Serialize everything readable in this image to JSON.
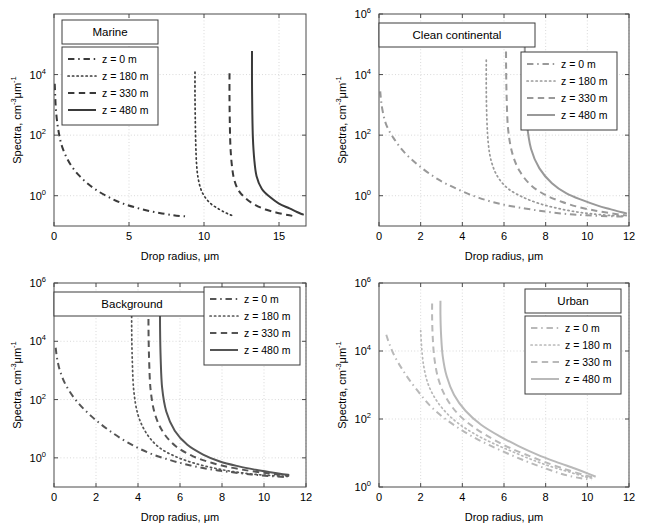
{
  "figure": {
    "width": 645,
    "height": 529,
    "background": "#ffffff",
    "panel_count": 4
  },
  "common": {
    "xlabel": "Drop radius, μm",
    "ylabel_main": "Spectra, cm",
    "ylabel_sup1": "-3",
    "ylabel_mid": "μm",
    "ylabel_sup2": "-1",
    "ylabel_full": "Spectra, cm-3 μm-1",
    "legend_labels": [
      "z = 0 m",
      "z = 180 m",
      "z = 330 m",
      "z = 480 m"
    ],
    "line_styles": [
      "dashdot",
      "dotted",
      "dashed",
      "solid"
    ],
    "mantissa": "10"
  },
  "chart_data": [
    {
      "type": "line",
      "title": "Marine",
      "panel_index": 0,
      "position": "top-left",
      "xlabel": "Drop radius, μm",
      "ylabel": "Spectra, cm-3 μm-1",
      "xlim": [
        0,
        16.8
      ],
      "ylim": [
        0.1,
        1000000
      ],
      "xticks": [
        0,
        5,
        10,
        15
      ],
      "xticklabels": [
        "0",
        "5",
        "10",
        "15"
      ],
      "yticks": [
        1,
        100,
        10000
      ],
      "yticklabels": [
        "10^0",
        "10^2",
        "10^4"
      ],
      "ytick_exponents": [
        "0",
        "2",
        "4"
      ],
      "yscale": "log",
      "grid": true,
      "legend_position": "upper-left",
      "title_box_position": "upper-left-above-legend",
      "line_color": "#3a3a3a",
      "series": [
        {
          "name": "z = 0 m",
          "style": "dashdot",
          "x": [
            0.05,
            0.08,
            0.12,
            0.2,
            0.32,
            0.5,
            0.8,
            1.2,
            1.7,
            2.3,
            3.0,
            3.8,
            4.6,
            5.5,
            6.4,
            7.2,
            7.9,
            8.4,
            8.7,
            8.9
          ],
          "y": [
            5000,
            2000,
            800,
            300,
            120,
            48,
            20,
            9.0,
            4.5,
            2.4,
            1.35,
            0.82,
            0.55,
            0.4,
            0.31,
            0.26,
            0.23,
            0.215,
            0.21,
            0.205
          ]
        },
        {
          "name": "z = 180 m",
          "style": "dotted",
          "x": [
            9.4,
            9.4,
            9.42,
            9.45,
            9.5,
            9.6,
            9.8,
            10.1,
            10.5,
            11.0,
            11.4,
            11.7,
            11.9,
            12.0
          ],
          "y": [
            12000,
            2000,
            300,
            50,
            12,
            4.0,
            1.6,
            0.85,
            0.52,
            0.36,
            0.28,
            0.24,
            0.22,
            0.21
          ]
        },
        {
          "name": "z = 330 m",
          "style": "dashed",
          "x": [
            11.7,
            11.7,
            11.72,
            11.76,
            11.85,
            12.0,
            12.3,
            12.8,
            13.4,
            14.1,
            14.8,
            15.3,
            15.7,
            15.9
          ],
          "y": [
            11000,
            1800,
            280,
            45,
            11,
            3.6,
            1.5,
            0.8,
            0.5,
            0.35,
            0.28,
            0.245,
            0.225,
            0.215
          ]
        },
        {
          "name": "z = 480 m",
          "style": "solid",
          "x": [
            13.2,
            13.2,
            13.22,
            13.26,
            13.35,
            13.5,
            13.85,
            14.4,
            15.0,
            15.7,
            16.2,
            16.5,
            16.65
          ],
          "y": [
            60000,
            6000,
            600,
            80,
            16,
            4.5,
            1.7,
            0.9,
            0.55,
            0.38,
            0.29,
            0.25,
            0.235
          ]
        }
      ]
    },
    {
      "type": "line",
      "title": "Clean continental",
      "panel_index": 1,
      "position": "top-right",
      "xlabel": "Drop radius, μm",
      "ylabel": "Spectra, cm-3 μm-1",
      "xlim": [
        0,
        12
      ],
      "ylim": [
        0.1,
        1000000
      ],
      "xticks": [
        0,
        2,
        4,
        6,
        8,
        10,
        12
      ],
      "xticklabels": [
        "0",
        "2",
        "4",
        "6",
        "8",
        "10",
        "12"
      ],
      "yticks": [
        1,
        100,
        10000,
        1000000
      ],
      "yticklabels": [
        "10^0",
        "10^2",
        "10^4",
        "10^6"
      ],
      "ytick_exponents": [
        "0",
        "2",
        "4",
        "6"
      ],
      "yscale": "log",
      "grid": true,
      "legend_position": "middle-right",
      "title_box_position": "top-left-wide",
      "line_color": "#999999",
      "series": [
        {
          "name": "z = 0 m",
          "style": "dashdot",
          "x": [
            0.06,
            0.1,
            0.18,
            0.35,
            0.7,
            1.2,
            1.9,
            2.8,
            3.8,
            4.8,
            5.9,
            7.0,
            8.0,
            9.0,
            10.0,
            11.0,
            11.7
          ],
          "y": [
            2800,
            1400,
            600,
            220,
            80,
            28,
            10,
            3.6,
            1.6,
            0.85,
            0.52,
            0.38,
            0.3,
            0.25,
            0.225,
            0.21,
            0.205
          ]
        },
        {
          "name": "z = 180 m",
          "style": "dotted",
          "x": [
            5.15,
            5.15,
            5.18,
            5.25,
            5.4,
            5.7,
            6.2,
            6.9,
            7.7,
            8.6,
            9.5,
            10.4,
            11.2,
            11.8
          ],
          "y": [
            30000,
            3000,
            300,
            50,
            13,
            4.2,
            1.7,
            0.9,
            0.55,
            0.38,
            0.29,
            0.245,
            0.22,
            0.21
          ]
        },
        {
          "name": "z = 330 m",
          "style": "dashed",
          "x": [
            6.1,
            6.1,
            6.13,
            6.2,
            6.4,
            6.75,
            7.3,
            8.0,
            8.8,
            9.6,
            10.4,
            11.1,
            11.6,
            11.9
          ],
          "y": [
            300000,
            20000,
            1500,
            150,
            25,
            6.5,
            2.2,
            1.05,
            0.62,
            0.42,
            0.32,
            0.265,
            0.235,
            0.22
          ]
        },
        {
          "name": "z = 480 m",
          "style": "solid",
          "x": [
            7.0,
            7.0,
            7.03,
            7.1,
            7.3,
            7.7,
            8.3,
            9.0,
            9.8,
            10.5,
            11.1,
            11.6,
            11.9
          ],
          "y": [
            400000,
            30000,
            2500,
            250,
            35,
            8.0,
            2.6,
            1.2,
            0.7,
            0.47,
            0.36,
            0.29,
            0.26
          ]
        }
      ]
    },
    {
      "type": "line",
      "title": "Background",
      "panel_index": 2,
      "position": "bottom-left",
      "xlabel": "Drop radius, μm",
      "ylabel": "Spectra, cm-3 μm-1",
      "xlim": [
        0,
        12
      ],
      "ylim": [
        0.1,
        1000000
      ],
      "xticks": [
        0,
        2,
        4,
        6,
        8,
        10,
        12
      ],
      "xticklabels": [
        "0",
        "2",
        "4",
        "6",
        "8",
        "10",
        "12"
      ],
      "yticks": [
        1,
        100,
        10000,
        1000000
      ],
      "yticklabels": [
        "10^0",
        "10^2",
        "10^4",
        "10^6"
      ],
      "ytick_exponents": [
        "0",
        "2",
        "4",
        "6"
      ],
      "yscale": "log",
      "grid": true,
      "legend_position": "top-right",
      "title_box_position": "top-left-wide",
      "line_color": "#555555",
      "series": [
        {
          "name": "z = 0 m",
          "style": "dashdot",
          "x": [
            0.08,
            0.15,
            0.3,
            0.6,
            1.1,
            1.8,
            2.6,
            3.5,
            4.5,
            5.5,
            6.5,
            7.5,
            8.5,
            9.4,
            10.2,
            10.8,
            11.1
          ],
          "y": [
            6000,
            2500,
            900,
            280,
            85,
            26,
            9.0,
            3.4,
            1.5,
            0.85,
            0.55,
            0.4,
            0.32,
            0.27,
            0.24,
            0.225,
            0.22
          ]
        },
        {
          "name": "z = 180 m",
          "style": "dotted",
          "x": [
            3.7,
            3.7,
            3.73,
            3.8,
            4.0,
            4.4,
            5.0,
            5.8,
            6.7,
            7.6,
            8.5,
            9.4,
            10.2,
            10.9,
            11.2
          ],
          "y": [
            300000,
            25000,
            2000,
            200,
            30,
            7.0,
            2.3,
            1.1,
            0.65,
            0.45,
            0.34,
            0.28,
            0.25,
            0.235,
            0.23
          ]
        },
        {
          "name": "z = 330 m",
          "style": "dashed",
          "x": [
            4.5,
            4.5,
            4.53,
            4.6,
            4.8,
            5.2,
            5.8,
            6.6,
            7.5,
            8.4,
            9.3,
            10.1,
            10.8,
            11.2
          ],
          "y": [
            320000,
            28000,
            2200,
            220,
            33,
            7.5,
            2.5,
            1.15,
            0.68,
            0.47,
            0.36,
            0.3,
            0.26,
            0.245
          ]
        },
        {
          "name": "z = 480 m",
          "style": "solid",
          "x": [
            5.05,
            5.05,
            5.08,
            5.15,
            5.35,
            5.75,
            6.35,
            7.1,
            7.9,
            8.8,
            9.6,
            10.3,
            10.9,
            11.2
          ],
          "y": [
            350000,
            30000,
            2500,
            250,
            38,
            8.5,
            2.8,
            1.3,
            0.75,
            0.51,
            0.39,
            0.32,
            0.275,
            0.26
          ]
        }
      ]
    },
    {
      "type": "line",
      "title": "Urban",
      "panel_index": 3,
      "position": "bottom-right",
      "xlabel": "Drop radius, μm",
      "ylabel": "Spectra, cm-3 μm-1",
      "xlim": [
        0,
        12
      ],
      "ylim": [
        1,
        1000000
      ],
      "xticks": [
        0,
        2,
        4,
        6,
        8,
        10,
        12
      ],
      "xticklabels": [
        "0",
        "2",
        "4",
        "6",
        "8",
        "10",
        "12"
      ],
      "yticks": [
        1,
        100,
        10000,
        1000000
      ],
      "yticklabels": [
        "10^0",
        "10^2",
        "10^4",
        "10^6"
      ],
      "ytick_exponents": [
        "0",
        "2",
        "4",
        "6"
      ],
      "yscale": "log",
      "grid": true,
      "legend_position": "top-right",
      "title_box_position": "top-right-above-legend",
      "line_color": "#b9b9b9",
      "series": [
        {
          "name": "z = 0 m",
          "style": "dashdot",
          "x": [
            0.35,
            0.5,
            0.75,
            1.1,
            1.5,
            2.0,
            2.5,
            3.1,
            3.8,
            4.5,
            5.3,
            6.2,
            7.1,
            8.0,
            8.9,
            9.7,
            10.2
          ],
          "y": [
            30000,
            16000,
            7000,
            3000,
            1300,
            520,
            230,
            110,
            55,
            30,
            17,
            9.5,
            5.6,
            3.5,
            2.3,
            1.8,
            1.65
          ]
        },
        {
          "name": "z = 180 m",
          "style": "dotted",
          "x": [
            2.0,
            2.05,
            2.15,
            2.35,
            2.7,
            3.2,
            3.8,
            4.6,
            5.5,
            6.4,
            7.3,
            8.2,
            9.1,
            9.9,
            10.3
          ],
          "y": [
            40000,
            12000,
            3500,
            1100,
            400,
            160,
            75,
            36,
            19,
            11,
            6.5,
            4.1,
            2.8,
            2.0,
            1.8
          ]
        },
        {
          "name": "z = 330 m",
          "style": "dashed",
          "x": [
            2.55,
            2.55,
            2.58,
            2.66,
            2.85,
            3.2,
            3.75,
            4.5,
            5.4,
            6.3,
            7.3,
            8.2,
            9.1,
            9.9,
            10.35
          ],
          "y": [
            250000,
            90000,
            25000,
            6000,
            1500,
            450,
            150,
            60,
            27,
            14,
            7.8,
            4.8,
            3.1,
            2.2,
            1.9
          ]
        },
        {
          "name": "z = 480 m",
          "style": "solid",
          "x": [
            2.95,
            2.95,
            2.98,
            3.06,
            3.25,
            3.6,
            4.15,
            4.9,
            5.8,
            6.7,
            7.6,
            8.5,
            9.4,
            10.1,
            10.4
          ],
          "y": [
            300000,
            110000,
            30000,
            7000,
            1800,
            520,
            175,
            68,
            31,
            16,
            9.0,
            5.5,
            3.5,
            2.4,
            2.0
          ]
        }
      ]
    }
  ]
}
